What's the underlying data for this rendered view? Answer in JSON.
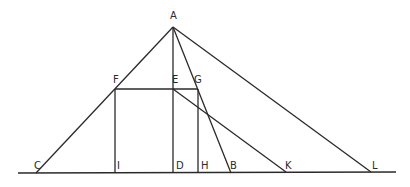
{
  "diagram": {
    "type": "geometric-construction",
    "baseline": {
      "x1": 18,
      "y1": 173,
      "x2": 396,
      "y2": 172
    },
    "points": {
      "A": {
        "x": 173,
        "y": 27,
        "label": "A",
        "lx": 170,
        "ly": 19
      },
      "F": {
        "x": 115,
        "y": 89,
        "label": "F",
        "lx": 113,
        "ly": 83
      },
      "E": {
        "x": 173,
        "y": 89,
        "label": "E",
        "lx": 172,
        "ly": 83
      },
      "G": {
        "x": 198,
        "y": 89,
        "label": "G",
        "lx": 194,
        "ly": 83
      },
      "C": {
        "x": 36,
        "y": 173,
        "label": "C",
        "lx": 34,
        "ly": 169
      },
      "I": {
        "x": 115,
        "y": 173,
        "label": "I",
        "lx": 117,
        "ly": 169
      },
      "D": {
        "x": 173,
        "y": 173,
        "label": "D",
        "lx": 176,
        "ly": 169
      },
      "H": {
        "x": 198,
        "y": 173,
        "label": "H",
        "lx": 201,
        "ly": 169
      },
      "B": {
        "x": 231,
        "y": 173,
        "label": "B",
        "lx": 230,
        "ly": 169
      },
      "K": {
        "x": 286,
        "y": 172,
        "label": "K",
        "lx": 285,
        "ly": 169
      },
      "L": {
        "x": 371,
        "y": 172,
        "label": "L",
        "lx": 372,
        "ly": 169
      }
    },
    "segments": [
      [
        "A",
        "C"
      ],
      [
        "A",
        "D"
      ],
      [
        "A",
        "B"
      ],
      [
        "A",
        "L"
      ],
      [
        "F",
        "G"
      ],
      [
        "F",
        "I"
      ],
      [
        "G",
        "H"
      ],
      [
        "E",
        "K"
      ]
    ],
    "labels": [
      "A",
      "F",
      "E",
      "G",
      "C",
      "I",
      "D",
      "H",
      "B",
      "K",
      "L"
    ]
  }
}
